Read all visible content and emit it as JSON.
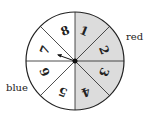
{
  "spinner": {
    "sections": [
      {
        "number": "1",
        "color": "red"
      },
      {
        "number": "2",
        "color": "red"
      },
      {
        "number": "3",
        "color": "red"
      },
      {
        "number": "4",
        "color": "red"
      },
      {
        "number": "5",
        "color": "blue"
      },
      {
        "number": "6",
        "color": "blue"
      },
      {
        "number": "7",
        "color": "blue"
      },
      {
        "number": "8",
        "color": "blue"
      }
    ],
    "labels": {
      "red": "red",
      "blue": "blue"
    },
    "shade_color": "#d9d9d9"
  }
}
